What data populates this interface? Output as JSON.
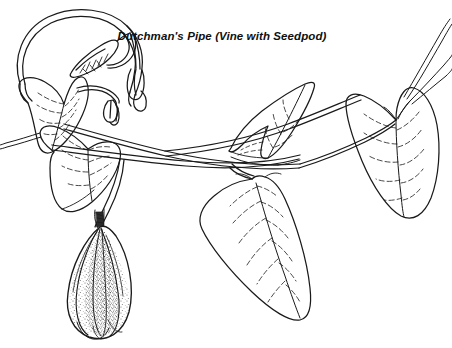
{
  "document": {
    "kind": "botanical-line-illustration",
    "background_color": "#ffffff",
    "ink_color": "#1a1a1a",
    "width_px": 452,
    "height_px": 348
  },
  "caption": {
    "text": "Dutchman's Pipe (Vine with Seedpod)",
    "style": "bold-italic",
    "align": "center",
    "color": "#101010"
  },
  "illustration": {
    "title": "Dutchman's Pipe (Vine with Seedpod)",
    "subject": "Aristolochia vine",
    "technique": "pen-and-ink line drawing with stipple shading",
    "parts": [
      {
        "name": "looping-tendril",
        "label": "Large looping vine tendril",
        "location": "upper-left"
      },
      {
        "name": "bract-pod",
        "label": "Small narrow bract with veins",
        "location": "inside-loop"
      },
      {
        "name": "flower-bud-pair",
        "label": "Hanging pipe-shaped flower buds",
        "location": "upper-left-center"
      },
      {
        "name": "leaf-upper-left",
        "label": "Heart-shaped leaf",
        "location": "left"
      },
      {
        "name": "leaf-lower-left",
        "label": "Folded heart-shaped leaf",
        "location": "left-center"
      },
      {
        "name": "leaf-center-upper",
        "label": "Edge-on leaf angled upward",
        "location": "center-top"
      },
      {
        "name": "leaf-center-lower",
        "label": "Large heart-shaped leaf hanging down",
        "location": "center-bottom"
      },
      {
        "name": "leaf-right",
        "label": "Heart-shaped leaf",
        "location": "right"
      },
      {
        "name": "seedpod",
        "label": "Ribbed elongated seedpod with stippled texture",
        "location": "lower-left"
      },
      {
        "name": "stems",
        "label": "Twining vine stems",
        "location": "across-center"
      },
      {
        "name": "tendril-tips",
        "label": "Thin stem tips",
        "location": "upper-right"
      }
    ]
  }
}
